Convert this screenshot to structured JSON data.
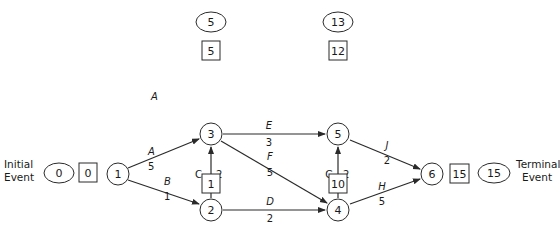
{
  "labels": {
    "initial_line1": "Initial",
    "initial_line2": "Event",
    "terminal_line1": "Terminal",
    "terminal_line2": "Event"
  },
  "nodes": [
    {
      "id": "1",
      "label": "1",
      "x": 118,
      "y": 174,
      "early_start": null,
      "late": null
    },
    {
      "id": "2",
      "label": "2",
      "x": 211,
      "y": 210,
      "early_start": "1",
      "late": "3"
    },
    {
      "id": "3",
      "label": "3",
      "x": 211,
      "y": 134,
      "early_start": "5",
      "late": "5"
    },
    {
      "id": "4",
      "label": "4",
      "x": 338,
      "y": 210,
      "early_start": "10",
      "late": "10"
    },
    {
      "id": "5",
      "label": "5",
      "x": 338,
      "y": 134,
      "early_start": "12",
      "late": "13"
    },
    {
      "id": "6",
      "label": "6",
      "x": 432,
      "y": 174,
      "early_start": "15",
      "late": "15"
    }
  ],
  "initial": {
    "ellipse": "0",
    "box": "0"
  },
  "terminal": {
    "box": "15",
    "ellipse": "15"
  },
  "above": {
    "n3_ellipse": "5",
    "n3_box": "5",
    "n5_ellipse": "13",
    "n5_box": "12"
  },
  "below": {
    "n2_box": "1",
    "n2_ellipse": "3",
    "n4_box": "10",
    "n4_ellipse": "10"
  },
  "activities": [
    {
      "name": "A",
      "duration": "5",
      "from": "1",
      "to": "3"
    },
    {
      "name": "B",
      "duration": "1",
      "from": "1",
      "to": "2"
    },
    {
      "name": "C",
      "duration": "2",
      "from": "2",
      "to": "3"
    },
    {
      "name": "D",
      "duration": "2",
      "from": "2",
      "to": "4"
    },
    {
      "name": "E",
      "duration": "3",
      "from": "3",
      "to": "5"
    },
    {
      "name": "F",
      "duration": "5",
      "from": "3",
      "to": "4"
    },
    {
      "name": "G",
      "duration": "2",
      "from": "4",
      "to": "5"
    },
    {
      "name": "H",
      "duration": "5",
      "from": "4",
      "to": "6"
    },
    {
      "name": "J",
      "duration": "2",
      "from": "5",
      "to": "6"
    }
  ]
}
